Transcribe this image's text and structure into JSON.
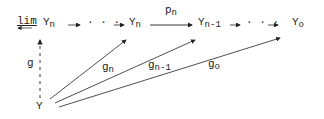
{
  "diagram": {
    "nodes": {
      "lim": {
        "prefix": "lim",
        "base": "Y",
        "sub": "n"
      },
      "dots1": "· · ·",
      "yn": {
        "base": "Y",
        "sub": "n"
      },
      "yn1": {
        "base": "Y",
        "sub": "n-1"
      },
      "dots2": "· · ·",
      "y0": {
        "base": "Y",
        "sub": "o"
      },
      "y": "Y"
    },
    "edges": {
      "pn": {
        "base": "p",
        "sub": "n"
      },
      "g": "g",
      "gn": {
        "base": "g",
        "sub": "n"
      },
      "gn1": {
        "base": "g",
        "sub": "n-1"
      },
      "g0": {
        "base": "g",
        "sub": "o"
      }
    },
    "colors": {
      "ink": "#222222",
      "background": "#ffffff"
    }
  }
}
